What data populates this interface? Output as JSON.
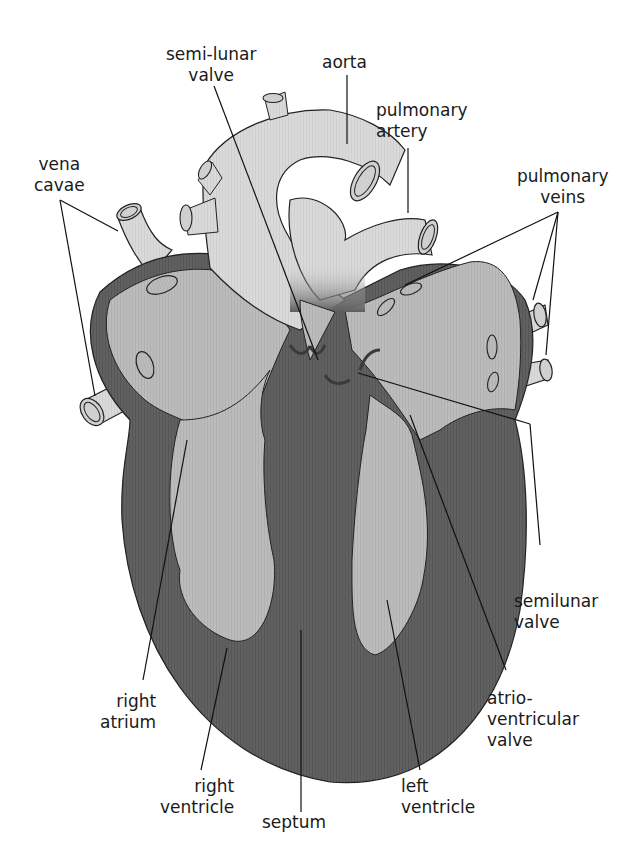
{
  "diagram": {
    "colors": {
      "background": "#ffffff",
      "vessel_fill": "#d9d9d9",
      "chamber_fill": "#b8b8b8",
      "muscle_fill": "#5e5e5e",
      "outline": "#222222",
      "label_text": "#1a1a1a"
    },
    "labels": {
      "semi_lunar_valve_top": {
        "line1": "semi-lunar",
        "line2": "valve"
      },
      "aorta": {
        "line1": "aorta"
      },
      "pulmonary_artery": {
        "line1": "pulmonary",
        "line2": "artery"
      },
      "vena_cavae": {
        "line1": "vena",
        "line2": "cavae"
      },
      "pulmonary_veins": {
        "line1": "pulmonary",
        "line2": "veins"
      },
      "semilunar_valve_right": {
        "line1": "semilunar",
        "line2": "valve"
      },
      "atrioventricular_valve": {
        "line1": "atrio-",
        "line2": "ventricular",
        "line3": "valve"
      },
      "right_atrium": {
        "line1": "right",
        "line2": "atrium"
      },
      "right_ventricle": {
        "line1": "right",
        "line2": "ventricle"
      },
      "septum": {
        "line1": "septum"
      },
      "left_ventricle": {
        "line1": "left",
        "line2": "ventricle"
      }
    }
  }
}
